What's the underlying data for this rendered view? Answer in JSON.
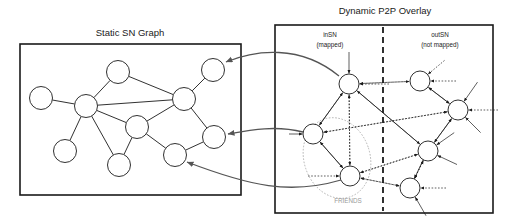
{
  "figure": {
    "width": 512,
    "height": 224,
    "background": "#ffffff",
    "ink_color": "#1a1a1a",
    "muted_color": "#9a9a9a",
    "mapping_arrow_color": "#555555"
  },
  "left_panel": {
    "title": "Static SN Graph",
    "title_x": 130,
    "title_y": 36,
    "box": {
      "x": 20,
      "y": 44,
      "w": 221,
      "h": 151
    },
    "node_radius": 11.5,
    "nodes": [
      {
        "id": "sn1",
        "cx": 41,
        "cy": 98
      },
      {
        "id": "sn2",
        "cx": 86,
        "cy": 106
      },
      {
        "id": "sn3",
        "cx": 118,
        "cy": 72
      },
      {
        "id": "sn4",
        "cx": 184,
        "cy": 99
      },
      {
        "id": "sn5",
        "cx": 213,
        "cy": 70
      },
      {
        "id": "sn6",
        "cx": 137,
        "cy": 127
      },
      {
        "id": "sn7",
        "cx": 65,
        "cy": 151
      },
      {
        "id": "sn8",
        "cx": 119,
        "cy": 165
      },
      {
        "id": "sn9",
        "cx": 175,
        "cy": 155
      },
      {
        "id": "sn10",
        "cx": 214,
        "cy": 137
      }
    ],
    "edges": [
      [
        "sn1",
        "sn2"
      ],
      [
        "sn2",
        "sn3"
      ],
      [
        "sn2",
        "sn4"
      ],
      [
        "sn3",
        "sn4"
      ],
      [
        "sn2",
        "sn6"
      ],
      [
        "sn2",
        "sn7"
      ],
      [
        "sn2",
        "sn8"
      ],
      [
        "sn4",
        "sn5"
      ],
      [
        "sn4",
        "sn6"
      ],
      [
        "sn4",
        "sn10"
      ],
      [
        "sn6",
        "sn8"
      ],
      [
        "sn6",
        "sn9"
      ],
      [
        "sn9",
        "sn10"
      ]
    ]
  },
  "right_panel": {
    "title": "Dynamic P2P Overlay",
    "title_x": 385,
    "title_y": 14,
    "box": {
      "x": 275,
      "y": 25,
      "w": 218,
      "h": 188
    },
    "divider_x": 383,
    "node_radius": 10,
    "sections": [
      {
        "id": "insn",
        "label_line1": "inSN",
        "label_line2": "(mapped)",
        "label_x": 330,
        "label_y1": 37,
        "label_y2": 47
      },
      {
        "id": "outsn",
        "label_line1": "outSN",
        "label_line2": "(not mapped)",
        "label_x": 440,
        "label_y1": 37,
        "label_y2": 47
      }
    ],
    "cluster": {
      "label": "FRIENDS",
      "label_x": 348,
      "label_y": 203,
      "ellipse": {
        "cx": 337,
        "cy": 158,
        "rx": 33,
        "ry": 41,
        "rotate": -18
      }
    },
    "nodes": [
      {
        "id": "p1",
        "cx": 349,
        "cy": 84,
        "section": "insn"
      },
      {
        "id": "p2",
        "cx": 313,
        "cy": 134,
        "section": "insn"
      },
      {
        "id": "p3",
        "cx": 350,
        "cy": 176,
        "section": "insn"
      },
      {
        "id": "p4",
        "cx": 420,
        "cy": 81,
        "section": "outsn"
      },
      {
        "id": "p5",
        "cx": 458,
        "cy": 110,
        "section": "outsn"
      },
      {
        "id": "p6",
        "cx": 428,
        "cy": 151,
        "section": "outsn"
      },
      {
        "id": "p7",
        "cx": 410,
        "cy": 188,
        "section": "outsn"
      }
    ],
    "overlay_edges": [
      {
        "from": "p1",
        "to": "p2",
        "style": "solid"
      },
      {
        "from": "p1",
        "to": "p3",
        "style": "dotted"
      },
      {
        "from": "p2",
        "to": "p3",
        "style": "solid"
      },
      {
        "from": "p1",
        "to": "p6",
        "style": "solid"
      },
      {
        "from": "p4",
        "to": "p1",
        "style": "dotted"
      },
      {
        "from": "p4",
        "to": "p5",
        "style": "solid"
      },
      {
        "from": "p5",
        "to": "p6",
        "style": "solid"
      },
      {
        "from": "p5",
        "to": "p2",
        "style": "dotted"
      },
      {
        "from": "p6",
        "to": "p3",
        "style": "dotted"
      },
      {
        "from": "p6",
        "to": "p7",
        "style": "dotted"
      },
      {
        "from": "p7",
        "to": "p3",
        "style": "dotted"
      }
    ],
    "stub_edges": [
      {
        "node": "p1",
        "angle": -90,
        "len": 22,
        "style": "solid"
      },
      {
        "node": "p1",
        "angle": 0,
        "len": 30,
        "style": "dotted"
      },
      {
        "node": "p4",
        "angle": -40,
        "len": 22,
        "style": "dotted"
      },
      {
        "node": "p4",
        "angle": 0,
        "len": 26,
        "style": "dotted"
      },
      {
        "node": "p5",
        "angle": -55,
        "len": 24,
        "style": "solid"
      },
      {
        "node": "p5",
        "angle": 0,
        "len": 30,
        "style": "dotted"
      },
      {
        "node": "p5",
        "angle": 45,
        "len": 22,
        "style": "solid"
      },
      {
        "node": "p6",
        "angle": -35,
        "len": 22,
        "style": "solid"
      },
      {
        "node": "p6",
        "angle": 25,
        "len": 22,
        "style": "solid"
      },
      {
        "node": "p7",
        "angle": -65,
        "len": 22,
        "style": "solid"
      },
      {
        "node": "p7",
        "angle": 0,
        "len": 26,
        "style": "dotted"
      },
      {
        "node": "p7",
        "angle": 60,
        "len": 22,
        "style": "solid"
      },
      {
        "node": "p3",
        "angle": 180,
        "len": 32,
        "style": "dotted"
      },
      {
        "node": "p2",
        "angle": 180,
        "len": 14,
        "style": "solid"
      }
    ]
  },
  "mapping_arrows": [
    {
      "id": "map1",
      "from_node": "p1",
      "to_node": "sn5",
      "path": "M 339 76 C 300 44 255 50 226 62"
    },
    {
      "id": "map2",
      "from_node": "p2",
      "to_node": "sn10",
      "path": "M 303 132 C 275 125 250 130 228 134"
    },
    {
      "id": "map3",
      "from_node": "p3",
      "to_node": "sn9",
      "path": "M 341 180 C 290 195 250 186 187 162"
    }
  ]
}
